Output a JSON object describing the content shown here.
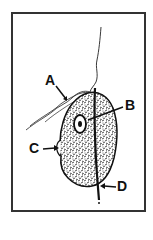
{
  "figure": {
    "labels": [
      {
        "id": "A",
        "text": "A"
      },
      {
        "id": "B",
        "text": "B"
      },
      {
        "id": "C",
        "text": "C"
      },
      {
        "id": "D",
        "text": "D"
      }
    ],
    "colors": {
      "ink": "#111111",
      "border": "#333333",
      "background": "#ffffff"
    }
  }
}
